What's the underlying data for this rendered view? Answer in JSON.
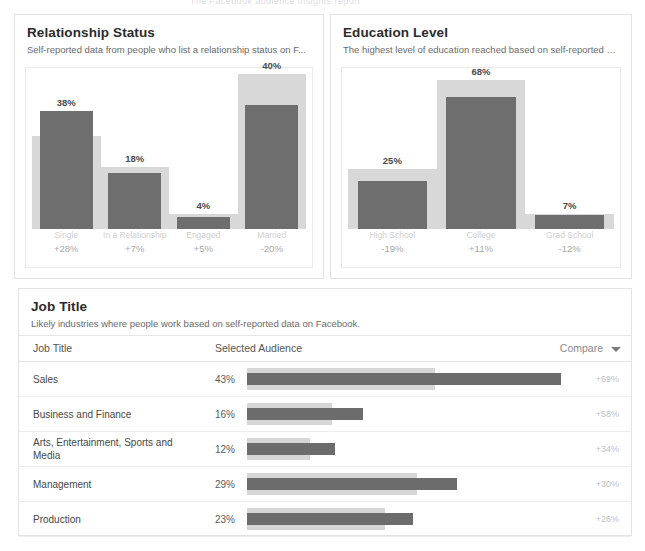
{
  "page": {
    "ghost_header": "The Facebook audience insights report"
  },
  "cards": {
    "relationship": {
      "title": "Relationship Status",
      "subtitle": "Self-reported data from people who list a relationship status on F..."
    },
    "education": {
      "title": "Education Level",
      "subtitle": "The highest level of education reached based on self-reported da..."
    },
    "job": {
      "title": "Job Title",
      "subtitle": "Likely industries where people work based on self-reported data on Facebook."
    }
  },
  "job_table": {
    "columns": {
      "name": "Job Title",
      "audience": "Selected Audience",
      "compare": "Compare"
    },
    "compare_icon": "chevron-down-icon"
  },
  "colors": {
    "selected_bar": "#6c6c6c",
    "compare_bar": "#d6d6d6",
    "card_border": "#e2e2e2",
    "title": "#2b2b2b",
    "subtitle": "#6a6a6a"
  },
  "chart_data": [
    {
      "type": "bar",
      "title": "Relationship Status",
      "subtitle": "Self-reported data from people who list a relationship status on F...",
      "xlabel": "",
      "ylabel": "",
      "ylim": [
        0,
        50
      ],
      "grid": false,
      "legend": "none",
      "categories": [
        "Single",
        "In a Relationship",
        "Engaged",
        "Married"
      ],
      "series": [
        {
          "name": "Selected Audience",
          "values": [
            38,
            18,
            4,
            40
          ],
          "color": "#6e6e6e"
        },
        {
          "name": "Compare",
          "values": [
            30,
            20,
            5,
            50
          ],
          "color": "#d8d8d8"
        }
      ],
      "data_labels": [
        "38%",
        "18%",
        "4%",
        "40%"
      ],
      "annotations": [
        "+28%",
        "+7%",
        "+5%",
        "-20%"
      ]
    },
    {
      "type": "bar",
      "title": "Education Level",
      "subtitle": "The highest level of education reached based on self-reported da...",
      "xlabel": "",
      "ylabel": "",
      "ylim": [
        0,
        80
      ],
      "grid": false,
      "legend": "none",
      "categories": [
        "High School",
        "College",
        "Grad School"
      ],
      "series": [
        {
          "name": "Selected Audience",
          "values": [
            25,
            68,
            7
          ],
          "color": "#6e6e6e"
        },
        {
          "name": "Compare",
          "values": [
            31,
            77,
            8
          ],
          "color": "#d8d8d8"
        }
      ],
      "data_labels": [
        "25%",
        "68%",
        "7%"
      ],
      "annotations": [
        "-19%",
        "+11%",
        "-12%"
      ]
    },
    {
      "type": "bar",
      "orientation": "horizontal",
      "title": "Job Title",
      "subtitle": "Likely industries where people work based on self-reported data on Facebook.",
      "xlabel": "",
      "ylabel": "",
      "xlim": [
        0,
        55
      ],
      "grid": false,
      "legend": "none",
      "categories": [
        "Sales",
        "Business and Finance",
        "Arts, Entertainment, Sports and Media",
        "Management",
        "Production"
      ],
      "series": [
        {
          "name": "Selected Audience",
          "values": [
            43,
            16,
            12,
            29,
            23
          ],
          "color": "#6c6c6c"
        },
        {
          "name": "Compare",
          "values": [
            26,
            10,
            8,
            22,
            18
          ],
          "color": "#d6d6d6"
        }
      ],
      "data_labels": [
        "43%",
        "16%",
        "12%",
        "29%",
        "23%"
      ],
      "annotations": [
        "+69%",
        "+58%",
        "+34%",
        "+30%",
        "+26%"
      ]
    }
  ],
  "job_rows": [
    {
      "name": "Sales",
      "pct": "43%",
      "bar_fore": 100,
      "bar_back": 60,
      "delta": "+69%"
    },
    {
      "name": "Business and Finance",
      "pct": "16%",
      "bar_fore": 37,
      "bar_back": 27,
      "delta": "+58%"
    },
    {
      "name": "Arts, Entertainment, Sports and Media",
      "pct": "12%",
      "bar_fore": 28,
      "bar_back": 20,
      "delta": "+34%"
    },
    {
      "name": "Management",
      "pct": "29%",
      "bar_fore": 67,
      "bar_back": 54,
      "delta": "+30%"
    },
    {
      "name": "Production",
      "pct": "23%",
      "bar_fore": 53,
      "bar_back": 44,
      "delta": "+26%"
    }
  ]
}
